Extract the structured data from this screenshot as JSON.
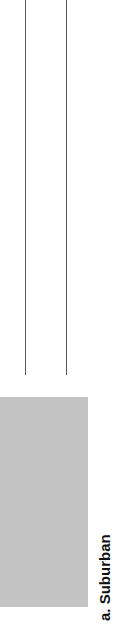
{
  "figure": {
    "caption": "a. Suburban",
    "image_placeholder_color": "#c4c4c4",
    "line_color": "#555555"
  }
}
